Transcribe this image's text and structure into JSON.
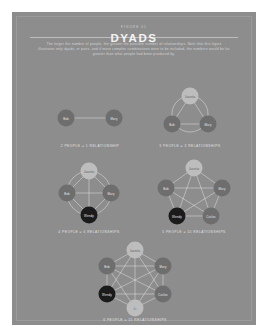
{
  "poster": {
    "background_color": "#8d8d8d",
    "page_background": "#ffffff",
    "accent_light": "#bdbdbd",
    "accent_dark": "#1b1b1b",
    "node_color": "#6e6e6e"
  },
  "header": {
    "eyebrow": "FIGURE 01",
    "title": "DYADS",
    "description": "The larger the number of people, the greater the possible number of relationships. Note that this figure illustrates only dyads, or pairs, and if more complex combinations were to be included, the numbers would be far greater than what people had been produced by."
  },
  "diagrams": [
    {
      "id": "dyad-2",
      "caption": "2 PEOPLE = 1 RELATIONSHIP",
      "people": 2,
      "relationships": 1,
      "nodes": [
        {
          "label": "Bob",
          "style": "n-mid"
        },
        {
          "label": "Mary",
          "style": "n-mid"
        }
      ]
    },
    {
      "id": "dyad-3",
      "caption": "3 PEOPLE = 3 RELATIONSHIPS",
      "people": 3,
      "relationships": 3,
      "nodes": [
        {
          "label": "Juanita",
          "style": "n-light"
        },
        {
          "label": "Bob",
          "style": "n-mid"
        },
        {
          "label": "Mary",
          "style": "n-mid"
        }
      ]
    },
    {
      "id": "dyad-4",
      "caption": "4 PEOPLE = 6 RELATIONSHIPS",
      "people": 4,
      "relationships": 6,
      "nodes": [
        {
          "label": "Juanita",
          "style": "n-light"
        },
        {
          "label": "Bob",
          "style": "n-mid"
        },
        {
          "label": "Mary",
          "style": "n-mid"
        },
        {
          "label": "Wendy",
          "style": "n-dark"
        }
      ]
    },
    {
      "id": "dyad-5",
      "caption": "5 PEOPLE = 10 RELATIONSHIPS",
      "people": 5,
      "relationships": 10,
      "nodes": [
        {
          "label": "Juanita",
          "style": "n-light"
        },
        {
          "label": "Bob",
          "style": "n-mid"
        },
        {
          "label": "Mary",
          "style": "n-mid"
        },
        {
          "label": "Wendy",
          "style": "n-dark"
        },
        {
          "label": "Carlos",
          "style": "n-mid"
        }
      ]
    },
    {
      "id": "dyad-6",
      "caption": "6 PEOPLE = 15 RELATIONSHIPS",
      "people": 6,
      "relationships": 15,
      "nodes": [
        {
          "label": "Juanita",
          "style": "n-light"
        },
        {
          "label": "Bob",
          "style": "n-mid"
        },
        {
          "label": "Mary",
          "style": "n-mid"
        },
        {
          "label": "Wendy",
          "style": "n-dark"
        },
        {
          "label": "Carlos",
          "style": "n-mid"
        },
        {
          "label": "Li",
          "style": "n-light"
        }
      ]
    }
  ]
}
